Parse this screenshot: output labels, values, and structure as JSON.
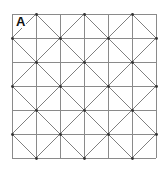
{
  "figure": {
    "label": "A",
    "grid": {
      "left": 12,
      "top": 14,
      "cell": 24,
      "cols": 6,
      "rows": 6,
      "line_color": "#8a8a8a",
      "border_color": "#8a8a8a"
    },
    "diagonals": {
      "spacing": 48,
      "line_color": "#808080",
      "x_minus_y": [
        -122,
        -74,
        -26,
        22,
        70,
        118
      ],
      "x_plus_y": [
        50,
        98,
        146,
        194,
        242,
        290
      ]
    },
    "nodes": {
      "color": "#333333",
      "radius": 1.4
    }
  }
}
